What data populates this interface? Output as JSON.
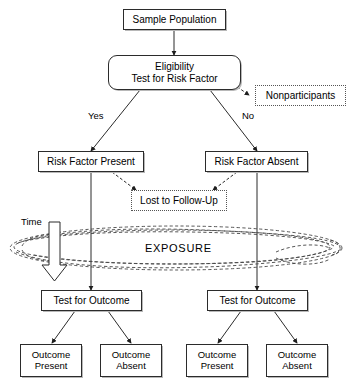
{
  "diagram": {
    "stroke_color": "#2b2b2b",
    "dashed_color": "#555555",
    "background": "#ffffff"
  },
  "nodes": {
    "sample_population": {
      "label": "Sample Population",
      "shape": "rectangle"
    },
    "eligibility": {
      "line1": "Eligibility",
      "line2": "Test for Risk Factor",
      "shape": "rounded-rectangle"
    },
    "nonparticipants": {
      "label": "Nonparticipants",
      "shape": "dotted-rectangle"
    },
    "risk_present": {
      "label": "Risk Factor Present",
      "shape": "rectangle"
    },
    "risk_absent": {
      "label": "Risk Factor Absent",
      "shape": "rectangle"
    },
    "lost_follow_up": {
      "label": "Lost to Follow-Up",
      "shape": "dotted-rectangle"
    },
    "exposure": {
      "label": "EXPOSURE",
      "shape": "cloud"
    },
    "test_outcome_left": {
      "label": "Test for Outcome",
      "shape": "rectangle"
    },
    "test_outcome_right": {
      "label": "Test for Outcome",
      "shape": "rectangle"
    },
    "outcome_present_left": {
      "line1": "Outcome",
      "line2": "Present",
      "shape": "rectangle"
    },
    "outcome_absent_left": {
      "line1": "Outcome",
      "line2": "Absent",
      "shape": "rectangle"
    },
    "outcome_present_right": {
      "line1": "Outcome",
      "line2": "Present",
      "shape": "rectangle"
    },
    "outcome_absent_right": {
      "line1": "Outcome",
      "line2": "Absent",
      "shape": "rectangle"
    }
  },
  "edge_labels": {
    "yes": "Yes",
    "no": "No",
    "time": "Time"
  }
}
